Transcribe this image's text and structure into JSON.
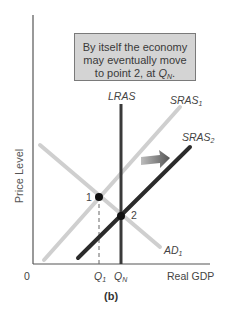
{
  "callout": {
    "line1": "By itself the economy",
    "line2": "may eventually move",
    "line3_prefix": "to point 2, at ",
    "line3_var": "Q",
    "line3_sub": "N",
    "line3_suffix": "."
  },
  "axes": {
    "y_label": "Price Level",
    "x_label": "Real GDP",
    "origin": "0"
  },
  "curves": {
    "lras": "LRAS",
    "sras1": {
      "base": "SRAS",
      "sub": "1"
    },
    "sras2": {
      "base": "SRAS",
      "sub": "2"
    },
    "ad1": {
      "base": "AD",
      "sub": "1"
    }
  },
  "points": {
    "p1": "1",
    "p2": "2"
  },
  "ticks": {
    "q1": {
      "base": "Q",
      "sub": "1"
    },
    "qn": {
      "base": "Q",
      "sub": "N"
    }
  },
  "caption": "(b)",
  "colors": {
    "light_curve": "#cfcfcf",
    "dark_curve": "#2b2b2b",
    "axis": "#555555",
    "callout_bg": "#d4d4d4",
    "arrow": "#6a6a6a"
  }
}
